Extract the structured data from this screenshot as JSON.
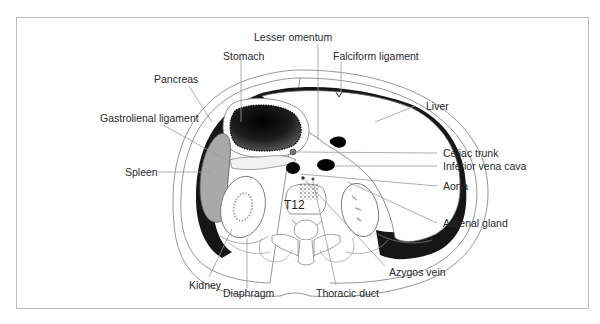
{
  "figure": {
    "vertebra_label": "T12",
    "caption": "",
    "colors": {
      "frame": "#bdbdbd",
      "outline": "#8a8a8a",
      "dark_space": "#1a1a1a",
      "spleen": "#a9a9a9",
      "stomach_lumen": "#0d0d0d",
      "leader_line": "#9a9a9a",
      "text": "#2a2a2a"
    }
  },
  "labels": {
    "lesser_omentum": "Lesser omentum",
    "stomach": "Stomach",
    "falciform_ligament": "Falciform ligament",
    "pancreas": "Pancreas",
    "liver": "Liver",
    "gastrolienal_ligament": "Gastrolienal ligament",
    "celiac_trunk": "Celiac trunk",
    "inferior_vena_cava": "Inferior vena cava",
    "spleen": "Spleen",
    "aorta": "Aorta",
    "adrenal_gland": "Adrenal gland",
    "azygos_vein": "Azygos vein",
    "kidney": "Kidney",
    "diaphragm": "Diaphragm",
    "thoracic_duct": "Thoracic duct"
  }
}
